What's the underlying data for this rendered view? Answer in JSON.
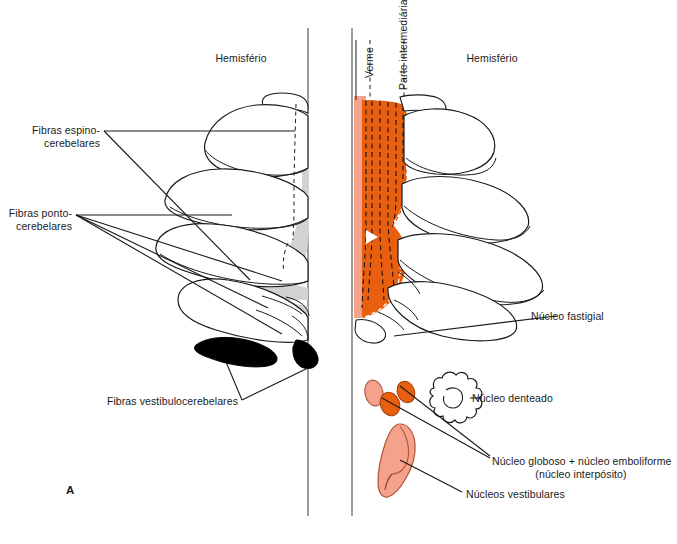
{
  "figure": {
    "panel_id": "A",
    "left_panel": {
      "region_label": "Hemisfério",
      "annotations": [
        {
          "id": "spinocerebellar",
          "line1": "Fibras espino-",
          "line2": "cerebelares"
        },
        {
          "id": "pontocerebellar",
          "line1": "Fibras ponto-",
          "line2": "cerebelares"
        },
        {
          "id": "vestibulocerebellar",
          "line1": "Fibras vestibulocerebelares",
          "line2": ""
        }
      ]
    },
    "right_panel": {
      "region_label": "Hemisfério",
      "vertical_labels": [
        {
          "id": "vermis",
          "text": "Verme"
        },
        {
          "id": "intermediate-part",
          "text": "Parte intermediária"
        }
      ],
      "annotations": [
        {
          "id": "fastigial",
          "line1": "Núcleo fastigial",
          "line2": ""
        },
        {
          "id": "dentate",
          "line1": "Núcleo denteado",
          "line2": ""
        },
        {
          "id": "interposed",
          "line1": "Núcleo globoso + núcleo emboliforme",
          "line2": "(núcleo interpósito)"
        },
        {
          "id": "vestibular",
          "line1": "Núcleos vestibulares",
          "line2": ""
        }
      ]
    }
  },
  "colors": {
    "orange": "#E8600F",
    "orange_dark": "#C94D08",
    "salmon": "#F4A28C",
    "salmon_dark": "#E8836A",
    "gray_shade": "#D2D2D2",
    "black": "#000000",
    "stroke": "#1a1a1a",
    "background": "#FFFFFF"
  }
}
